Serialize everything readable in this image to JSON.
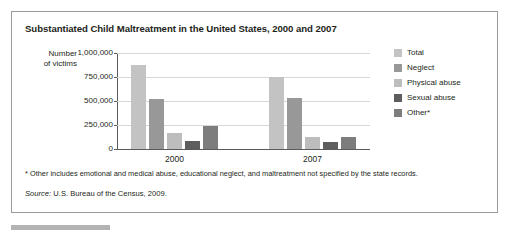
{
  "figure": {
    "title": "Substantiated Child Maltreatment in the United States, 2000 and 2007",
    "footnote": "* Other includes emotional and medical abuse, educational neglect, and maltreatment not specified by the state records.",
    "source_word": "Source:",
    "source_text": " U.S. Bureau of the Census, 2009."
  },
  "chart_data": {
    "type": "bar",
    "title": "Substantiated Child Maltreatment in the United States, 2000 and 2007",
    "xlabel": "",
    "ylabel": "Number of victims",
    "ylabel_lines": [
      "Number",
      "of victims"
    ],
    "categories": [
      "2000",
      "2007"
    ],
    "ylim": [
      0,
      1000000
    ],
    "yticks": [
      0,
      250000,
      500000,
      750000,
      1000000
    ],
    "ytick_labels": [
      "0",
      "250,000",
      "500,000",
      "750,000",
      "1,000,000"
    ],
    "grid": true,
    "legend_position": "right",
    "series": [
      {
        "name": "Total",
        "color": "#c3c3c3",
        "values": [
          880000,
          750000
        ]
      },
      {
        "name": "Neglect",
        "color": "#989898",
        "values": [
          520000,
          530000
        ]
      },
      {
        "name": "Physical abuse",
        "color": "#bdbdbd",
        "values": [
          165000,
          120000
        ]
      },
      {
        "name": "Sexual abuse",
        "color": "#5e5e5e",
        "values": [
          85000,
          70000
        ]
      },
      {
        "name": "Other*",
        "color": "#7d7d7d",
        "values": [
          235000,
          125000
        ]
      }
    ]
  },
  "colors": {
    "border": "#9a9a9a",
    "axis": "#5b5b5b",
    "gridline": "#d7d7d7",
    "text": "#231f20",
    "bottom_rule": "#b3b3b3"
  }
}
